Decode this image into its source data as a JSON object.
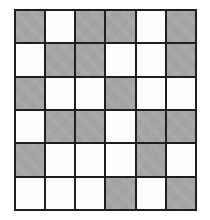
{
  "puzzle": {
    "rows": 6,
    "cols": 6,
    "colors": {
      "filled": "#a9a9a9",
      "empty": "#fdfdfd",
      "border": "#1e1e1e"
    },
    "cells": [
      [
        1,
        0,
        1,
        1,
        0,
        1
      ],
      [
        0,
        1,
        1,
        0,
        0,
        1
      ],
      [
        1,
        0,
        0,
        1,
        0,
        0
      ],
      [
        0,
        1,
        1,
        0,
        1,
        1
      ],
      [
        1,
        0,
        0,
        0,
        1,
        0
      ],
      [
        0,
        0,
        0,
        1,
        0,
        1
      ]
    ]
  }
}
